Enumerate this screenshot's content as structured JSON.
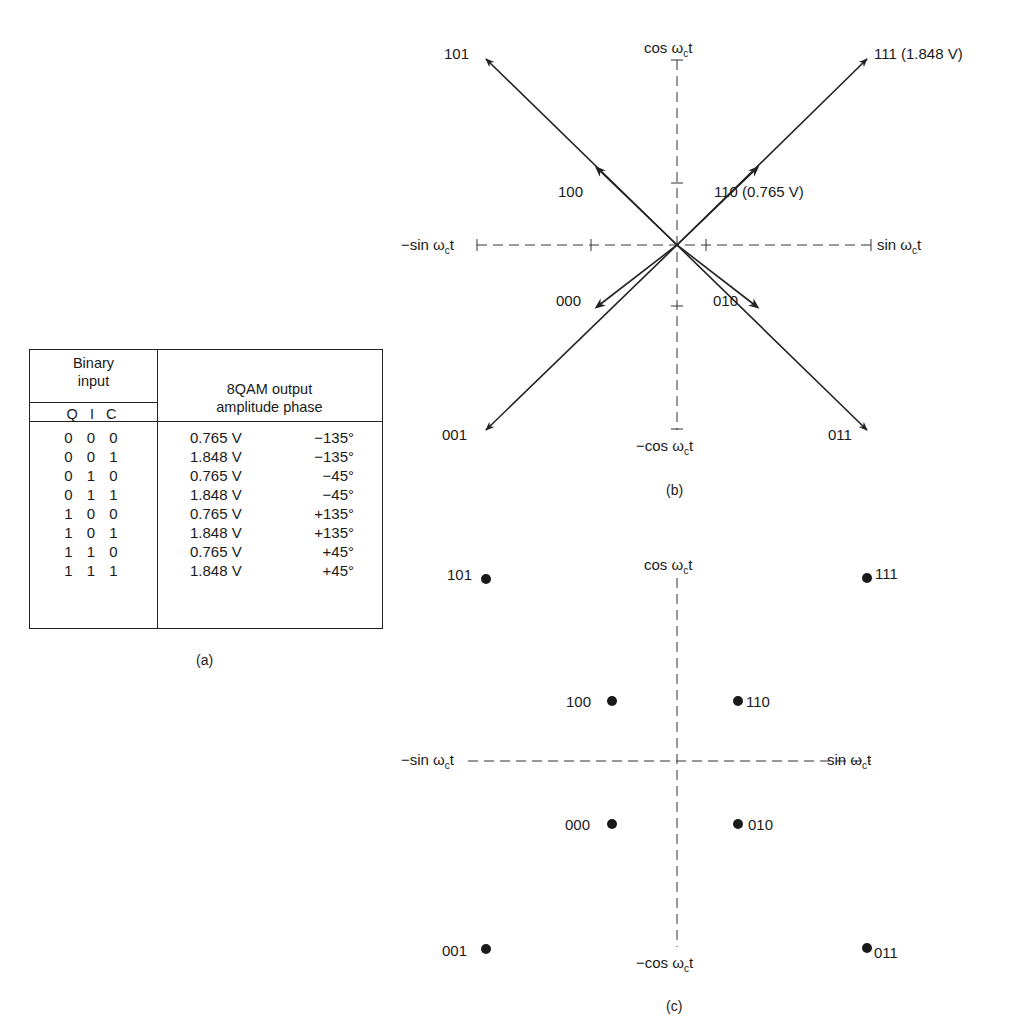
{
  "figure": {
    "table": {
      "caption": "(a)",
      "header": {
        "binary_input": [
          "Binary",
          "input"
        ],
        "binary_subheader": "Q I C",
        "output_title": "8QAM output",
        "output_subheader": "amplitude phase"
      },
      "rows": [
        {
          "bits": "0 0 0",
          "amplitude": "0.765 V",
          "phase": "−135°"
        },
        {
          "bits": "0 0 1",
          "amplitude": "1.848 V",
          "phase": "−135°"
        },
        {
          "bits": "0 1 0",
          "amplitude": "0.765 V",
          "phase": "−45°"
        },
        {
          "bits": "0 1 1",
          "amplitude": "1.848 V",
          "phase": "−45°"
        },
        {
          "bits": "1 0 0",
          "amplitude": "0.765 V",
          "phase": "+135°"
        },
        {
          "bits": "1 0 1",
          "amplitude": "1.848 V",
          "phase": "+135°"
        },
        {
          "bits": "1 1 0",
          "amplitude": "0.765 V",
          "phase": "+45°"
        },
        {
          "bits": "1 1 1",
          "amplitude": "1.848 V",
          "phase": "+45°"
        }
      ]
    },
    "phasor": {
      "caption": "(b)",
      "axes": {
        "top": "cos ω",
        "bottom": "−cos ω",
        "left": "−sin ω",
        "right": "sin ω",
        "sub": "c",
        "t": "t"
      },
      "labels": {
        "p101": "101",
        "p111": "111 (1.848 V)",
        "p100": "100",
        "p110": "110 (0.765 V)",
        "p000": "000",
        "p010": "010",
        "p001": "001",
        "p011": "011"
      }
    },
    "constellation": {
      "caption": "(c)",
      "axes": {
        "top": "cos ω",
        "bottom": "−cos ω",
        "left": "−sin ω",
        "right": "sin ω",
        "sub": "c",
        "t": "t"
      },
      "labels": {
        "p101": "101",
        "p111": "111",
        "p100": "100",
        "p110": "110",
        "p000": "000",
        "p010": "010",
        "p001": "001",
        "p011": "011"
      }
    }
  }
}
